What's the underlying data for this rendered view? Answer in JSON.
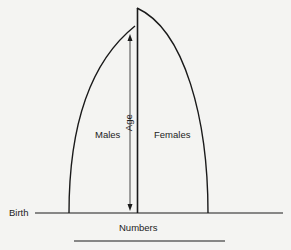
{
  "diagram": {
    "type": "population-pyramid-schematic",
    "labels": {
      "males": "Males",
      "females": "Females",
      "age": "Age",
      "birth": "Birth",
      "numbers": "Numbers"
    },
    "colors": {
      "ink": "#1a1a1a",
      "background": "#f4f4f2"
    }
  }
}
